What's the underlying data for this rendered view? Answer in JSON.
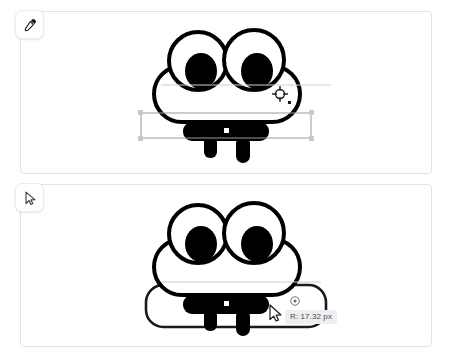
{
  "app": {
    "title": "Vector shape editor",
    "background_color": "#ffffff",
    "panel_border_color": "#e3e3e3"
  },
  "panels": [
    {
      "id": "panel-top",
      "name": "eyedropper-state-panel",
      "tool_button": {
        "name": "eyedropper-tool-button",
        "icon": "eyedropper-icon",
        "label": "Eyedropper",
        "active": false
      },
      "cursor": {
        "name": "crosshair-cursor",
        "icon": "crosshair-target-icon",
        "x": 279,
        "y": 96
      },
      "selection": {
        "visible": true,
        "stroke_color": "#9a9a9a",
        "handle_fill": "#c9c9c9",
        "x": 140,
        "y": 112,
        "width": 170,
        "height": 25
      },
      "center_handle": {
        "name": "center-handle",
        "fill": "#ffffff",
        "x": 225,
        "y": 114
      }
    },
    {
      "id": "panel-bottom",
      "name": "pointer-state-panel",
      "tool_button": {
        "name": "pointer-tool-button",
        "icon": "arrow-pointer-icon",
        "label": "Select",
        "active": false
      },
      "cursor": {
        "name": "arrow-cursor",
        "icon": "arrow-cursor-icon",
        "x": 272,
        "y": 306
      },
      "radius_handle": {
        "name": "corner-radius-handle",
        "icon": "radius-handle-icon",
        "x": 294,
        "y": 300
      },
      "tooltip": {
        "name": "radius-tooltip",
        "text": "R: 17.32 px",
        "background": "#eceef1",
        "text_color": "#4a4a4a"
      },
      "drawn_shape": {
        "name": "rounded-rectangle-outline",
        "stroke_color": "#1a1a1a",
        "corner_radius_px": 17.32
      }
    }
  ],
  "artwork": {
    "name": "cloud-face-glyph",
    "description": "Black and white cloud shape with two large eyes and a bar-shaped mouth",
    "stroke_color": "#000000",
    "fill_color": "#ffffff",
    "pupil_color": "#000000"
  }
}
